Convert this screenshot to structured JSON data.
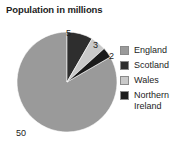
{
  "chart_data": {
    "type": "pie",
    "title": "Population in millions",
    "xlabel": "",
    "ylabel": "",
    "legend_position": "right",
    "grid": false,
    "unit": "millions",
    "total": 60,
    "categories": [
      "England",
      "Scotland",
      "Wales",
      "Northern Ireland"
    ],
    "values": [
      50,
      5,
      3,
      2
    ],
    "slices": [
      {
        "name": "England",
        "value": 50,
        "label": "50",
        "color": "#9a9a9a",
        "start_angle": 60,
        "sweep": 300
      },
      {
        "name": "Scotland",
        "value": 5,
        "label": "5",
        "color": "#2e2e2e",
        "start_angle": 0,
        "sweep": 30
      },
      {
        "name": "Wales",
        "value": 3,
        "label": "3",
        "color": "#c9c9c9",
        "start_angle": 30,
        "sweep": 18
      },
      {
        "name": "Northern Ireland",
        "value": 2,
        "label": "2",
        "color": "#1a1a1a",
        "start_angle": 48,
        "sweep": 12
      }
    ],
    "legend": [
      {
        "label": "England",
        "label_line2": "",
        "color": "#9a9a9a"
      },
      {
        "label": "Scotland",
        "label_line2": "",
        "color": "#2e2e2e"
      },
      {
        "label": "Wales",
        "label_line2": "",
        "color": "#c9c9c9"
      },
      {
        "label": "Northern",
        "label_line2": "Ireland",
        "color": "#1a1a1a"
      }
    ],
    "geometry": {
      "center_x": 67,
      "center_y": 68,
      "radius": 50
    }
  }
}
